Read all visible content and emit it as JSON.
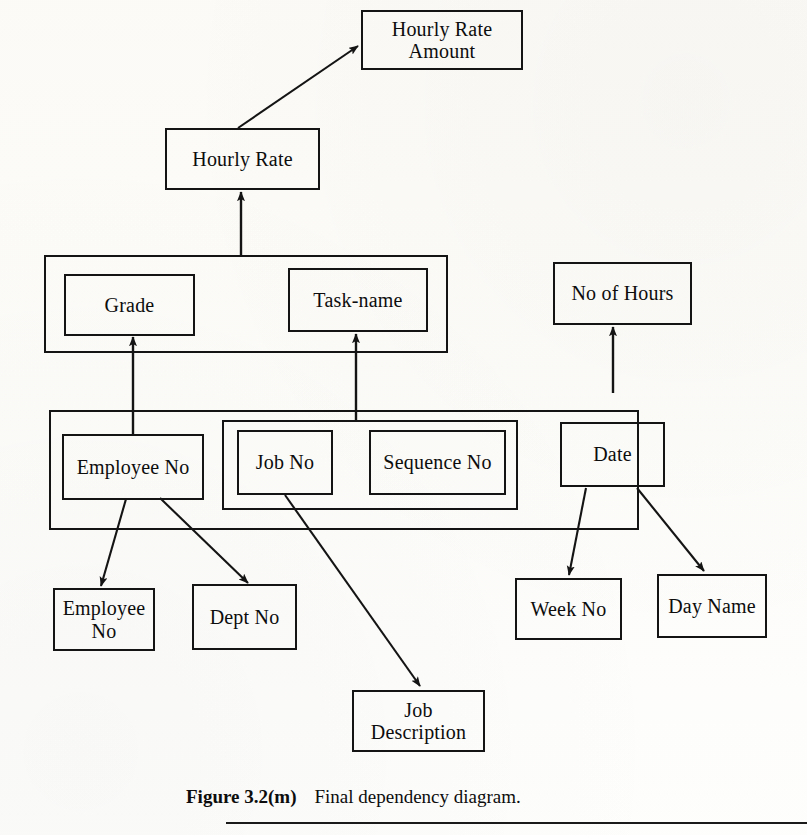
{
  "figure": {
    "number": "Figure 3.2(m)",
    "caption": "Final dependency diagram."
  },
  "diagram": {
    "type": "dependency-diagram",
    "nodes": [
      {
        "id": "hourly-rate-amount",
        "label": "Hourly Rate\nAmount",
        "x": 361,
        "y": 10,
        "w": 162,
        "h": 60
      },
      {
        "id": "hourly-rate",
        "label": "Hourly Rate",
        "x": 165,
        "y": 128,
        "w": 155,
        "h": 62
      },
      {
        "id": "grade",
        "label": "Grade",
        "x": 64,
        "y": 274,
        "w": 131,
        "h": 62
      },
      {
        "id": "task-name",
        "label": "Task-name",
        "x": 288,
        "y": 268,
        "w": 140,
        "h": 64
      },
      {
        "id": "no-of-hours",
        "label": "No of Hours",
        "x": 553,
        "y": 262,
        "w": 139,
        "h": 63
      },
      {
        "id": "employee-no-key",
        "label": "Employee No",
        "x": 62,
        "y": 434,
        "w": 142,
        "h": 66
      },
      {
        "id": "job-no",
        "label": "Job No",
        "x": 237,
        "y": 430,
        "w": 96,
        "h": 65
      },
      {
        "id": "sequence-no",
        "label": "Sequence No",
        "x": 369,
        "y": 430,
        "w": 137,
        "h": 65
      },
      {
        "id": "date",
        "label": "Date",
        "x": 560,
        "y": 422,
        "w": 105,
        "h": 65
      },
      {
        "id": "employee-no-dep",
        "label": "Employee\nNo",
        "x": 53,
        "y": 588,
        "w": 102,
        "h": 63
      },
      {
        "id": "dept-no",
        "label": "Dept No",
        "x": 192,
        "y": 584,
        "w": 105,
        "h": 66
      },
      {
        "id": "week-no",
        "label": "Week No",
        "x": 515,
        "y": 578,
        "w": 107,
        "h": 62
      },
      {
        "id": "day-name",
        "label": "Day Name",
        "x": 657,
        "y": 574,
        "w": 110,
        "h": 64
      },
      {
        "id": "job-description",
        "label": "Job\nDescription",
        "x": 352,
        "y": 690,
        "w": 133,
        "h": 62
      }
    ],
    "groups": [
      {
        "id": "determinant-grade-task",
        "x": 44,
        "y": 255,
        "w": 404,
        "h": 98
      },
      {
        "id": "composite-key-group",
        "x": 49,
        "y": 410,
        "w": 590,
        "h": 120
      },
      {
        "id": "job-sequence-group",
        "x": 222,
        "y": 420,
        "w": 296,
        "h": 90
      }
    ],
    "edges": [
      {
        "from": "hourly-rate",
        "to": "hourly-rate-amount"
      },
      {
        "from": "grade-task-group",
        "to": "hourly-rate"
      },
      {
        "from": "employee-no-key",
        "to": "grade"
      },
      {
        "from": "job-sequence-group",
        "to": "task-name"
      },
      {
        "from": "composite-key-group",
        "to": "no-of-hours"
      },
      {
        "from": "employee-no-key",
        "to": "employee-no-dep"
      },
      {
        "from": "employee-no-key",
        "to": "dept-no"
      },
      {
        "from": "job-no",
        "to": "job-description"
      },
      {
        "from": "date",
        "to": "week-no"
      },
      {
        "from": "date",
        "to": "day-name"
      }
    ]
  },
  "colors": {
    "ink": "#141414",
    "page": "#fdfdfb"
  }
}
